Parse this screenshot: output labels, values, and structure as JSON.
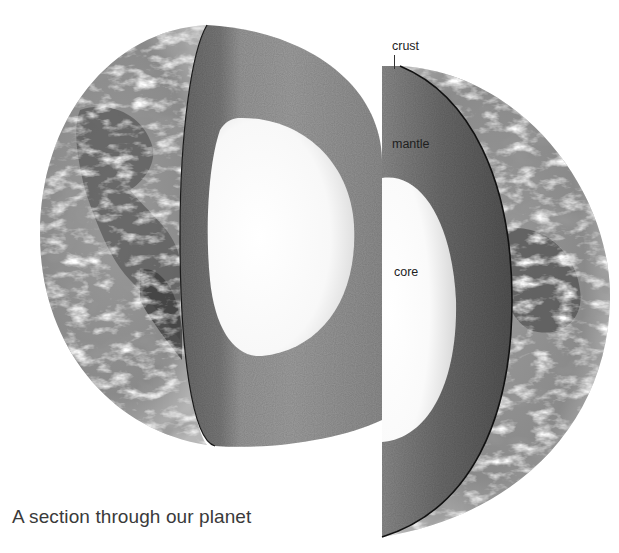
{
  "figure": {
    "caption": "A section through our planet",
    "labels": {
      "crust": "crust",
      "mantle": "mantle",
      "core": "core"
    },
    "layers": [
      {
        "name": "crust",
        "description": "thin outer shell (surface with clouds and oceans)"
      },
      {
        "name": "mantle",
        "description": "thick dark-grey middle layer"
      },
      {
        "name": "core",
        "description": "bright white centre"
      }
    ],
    "colors": {
      "background": "#ffffff",
      "mantle_dark": "#5e5e5e",
      "mantle_mid": "#8a8a8a",
      "mantle_light": "#b5b5b5",
      "core": "#fbfbfb",
      "ocean": "#8c8c8c",
      "land": "#5a5a5a",
      "cloud": "#e8e8e8",
      "edge": "#1a1a1a",
      "text": "#1e1e1e",
      "caption_text": "#3a3a3a"
    }
  }
}
